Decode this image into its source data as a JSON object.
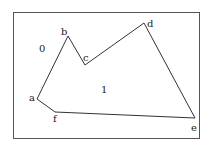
{
  "diagram": {
    "type": "polygon-region",
    "frame": {
      "x": 13,
      "y": 12,
      "width": 186,
      "height": 126
    },
    "vertices": [
      {
        "id": "a",
        "label": "a",
        "x": 37,
        "y": 99,
        "lx": 29,
        "ly": 101
      },
      {
        "id": "b",
        "label": "b",
        "x": 68,
        "y": 36,
        "lx": 61,
        "ly": 35
      },
      {
        "id": "c",
        "label": "c",
        "x": 85,
        "y": 65,
        "lx": 83,
        "ly": 61
      },
      {
        "id": "d",
        "label": "d",
        "x": 144,
        "y": 23,
        "lx": 147,
        "ly": 27
      },
      {
        "id": "e",
        "label": "e",
        "x": 195,
        "y": 118,
        "lx": 191,
        "ly": 131
      },
      {
        "id": "f",
        "label": "f",
        "x": 55,
        "y": 112,
        "lx": 53,
        "ly": 122
      }
    ],
    "regions": [
      {
        "id": "outside",
        "label": "0",
        "x": 39,
        "y": 52
      },
      {
        "id": "inside",
        "label": "1",
        "x": 101,
        "y": 93
      }
    ]
  }
}
